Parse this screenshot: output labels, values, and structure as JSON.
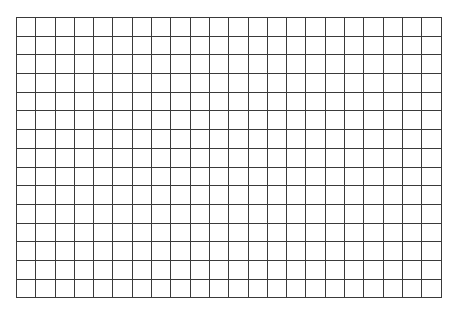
{
  "grid": {
    "columns": 22,
    "rows": 15,
    "cell_width": 19.3,
    "cell_height": 18.7,
    "line_color": "#3a3a3a",
    "background_color": "#ffffff"
  }
}
